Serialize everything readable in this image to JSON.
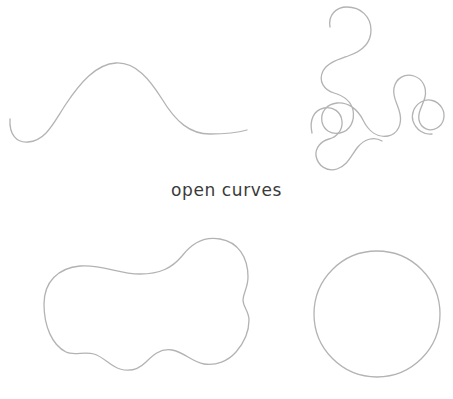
{
  "figure": {
    "background_color": "#ffffff",
    "stroke_color": "#b3b3b3",
    "stroke_width": 1.3,
    "caption_color": "#3a3a3a",
    "width": 453,
    "height": 399
  },
  "captions": {
    "open_curves": "open curves"
  },
  "shapes": [
    {
      "name": "wave-open-curve",
      "kind": "open-curve",
      "position": "top-left",
      "description": "single hump wave with upturned left hook and trailing right tail",
      "endpoints": 2,
      "path": "M 10 119 C 9 135 17 143 28 142 C 46 141 54 122 66 104 C 80 83 96 64 116 63 C 136 62 150 80 162 99 C 176 122 190 134 210 134 C 228 134 240 132 247 130"
    },
    {
      "name": "meander-open-curve",
      "kind": "open-curve",
      "position": "top-right",
      "description": "long winding meander with two free ends, upper-left hook and lower-left tail",
      "endpoints": 2,
      "path": "M 330 27 C 328 15 336 7 347 7 C 361 7 371 17 371 30 C 371 44 360 52 348 56 C 337 60 327 63 323 71 C 318 81 324 90 334 93 C 344 96 351 101 353 110 C 355 121 350 131 340 133 C 331 135 324 130 322 122 C 320 112 327 104 337 103 C 349 102 358 110 363 120 C 369 132 378 138 388 136 C 398 134 402 124 400 114 C 398 104 392 97 394 88 C 396 78 405 73 414 76 C 423 79 427 88 425 97 C 423 106 417 112 419 120 C 421 129 430 132 437 128 C 444 124 446 115 442 108 C 437 100 428 98 421 102 C 414 106 411 114 413 121 C 416 130 424 135 432 134"
    },
    {
      "name": "meander-open-curve-part2",
      "kind": "open-curve",
      "position": "top-right-lower",
      "description": "lower lobe continuation of the meander with free tail at left",
      "endpoints": 2,
      "path": "M 312 133 C 309 120 314 110 324 108 C 333 106 341 112 342 121 C 343 130 337 137 329 139 C 321 141 315 148 316 156 C 318 166 327 172 337 169 C 347 166 351 156 357 148 C 364 139 374 136 382 141"
    },
    {
      "name": "blob-closed-curve",
      "kind": "closed-curve",
      "position": "bottom-left",
      "description": "irregular amoeba blob with rounded left lobe, raised right hump, wavy bottom and a notch on the right edge",
      "endpoints": 0,
      "path": "M 44 304 C 44 282 58 268 80 266 C 102 264 118 274 140 274 C 160 274 172 268 182 256 C 192 243 204 236 220 239 C 238 242 248 257 248 277 C 248 288 243 293 243 300 C 243 307 249 311 249 320 C 249 334 243 344 236 352 C 228 361 216 366 204 364 C 192 362 184 352 172 350 C 160 348 152 356 146 362 C 139 369 130 372 120 369 C 110 366 104 357 94 354 C 84 351 74 356 66 352 C 52 345 44 326 44 304 Z"
    },
    {
      "name": "circle-closed-curve",
      "kind": "closed-curve",
      "position": "bottom-right",
      "description": "plain circle",
      "endpoints": 0,
      "center_x": 377,
      "center_y": 314,
      "radius": 63
    }
  ]
}
